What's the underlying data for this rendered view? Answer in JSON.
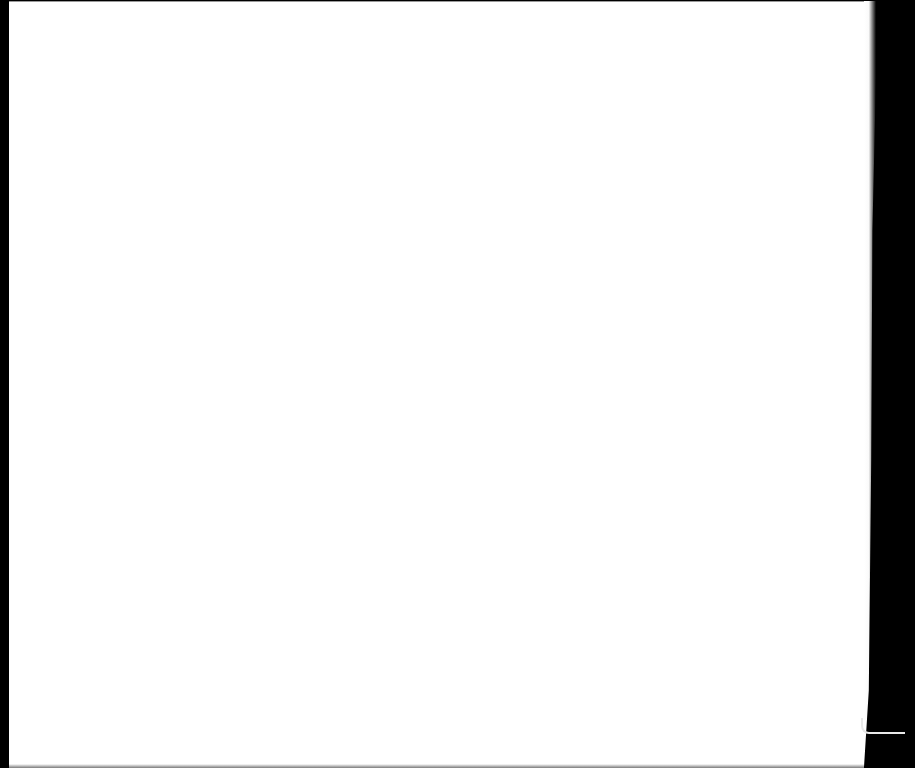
{
  "scene": {
    "description": "Blank white scanned page on black background",
    "background_color": "#000000",
    "page_color": "#ffffff",
    "text_content": ""
  }
}
